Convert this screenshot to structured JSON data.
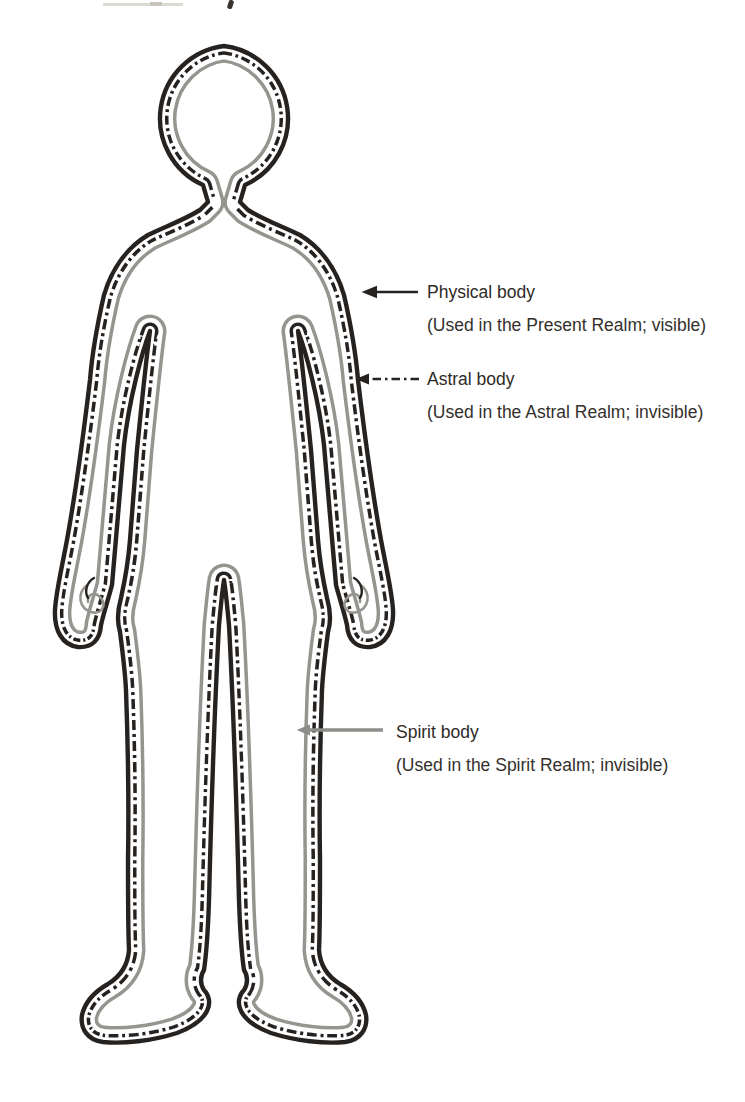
{
  "diagram": {
    "figure": "standing human body outline, front view, three nested outlines",
    "layers": [
      {
        "id": "physical",
        "label": "Physical body",
        "sublabel": "(Used in the Present Realm; visible)",
        "line_style": "solid",
        "color": "#262220"
      },
      {
        "id": "astral",
        "label": "Astral body",
        "sublabel": "(Used in the Astral Realm; invisible)",
        "line_style": "dash-dot",
        "color": "#262220"
      },
      {
        "id": "spirit",
        "label": "Spirit body",
        "sublabel": "(Used in the Spirit Realm; invisible)",
        "line_style": "solid",
        "color": "#96948f"
      }
    ]
  },
  "colors": {
    "line_black": "#262220",
    "spirit_gray": "#96948f",
    "arrow_gray": "#8e8c88",
    "text": "#34302c",
    "background": "#ffffff"
  }
}
